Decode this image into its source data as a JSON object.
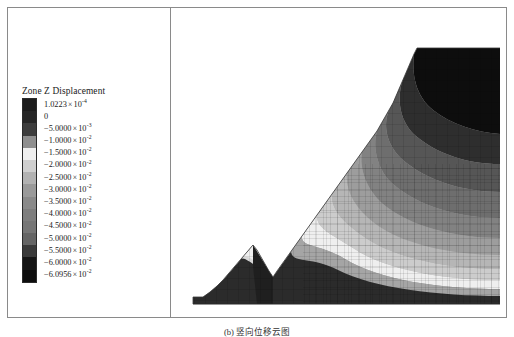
{
  "figure": {
    "caption": "(b) 竖向位移云图",
    "background_color": "#ffffff",
    "frame_color": "#8a8a8a"
  },
  "legend": {
    "title": "Zone Z Displacement",
    "entries": [
      {
        "label": "1.0223 × 10",
        "mantissa": "1.0223",
        "exponent": "-4",
        "color": "#1c1c1c"
      },
      {
        "label": "0",
        "mantissa": "0",
        "exponent": "",
        "color": "#262626"
      },
      {
        "label": "-5.0000 × 10",
        "mantissa": "−5.0000",
        "exponent": "-3",
        "color": "#3d3d3d"
      },
      {
        "label": "-1.0000 × 10",
        "mantissa": "−1.0000",
        "exponent": "-2",
        "color": "#8f8f8f"
      },
      {
        "label": "-1.5000 × 10",
        "mantissa": "−1.5000",
        "exponent": "-2",
        "color": "#efefef"
      },
      {
        "label": "-2.0000 × 10",
        "mantissa": "−2.0000",
        "exponent": "-2",
        "color": "#cfcfcf"
      },
      {
        "label": "-2.5000 × 10",
        "mantissa": "−2.5000",
        "exponent": "-2",
        "color": "#b2b2b2"
      },
      {
        "label": "-3.0000 × 10",
        "mantissa": "−3.0000",
        "exponent": "-2",
        "color": "#9a9a9a"
      },
      {
        "label": "-3.5000 × 10",
        "mantissa": "−3.5000",
        "exponent": "-2",
        "color": "#8a8a8a"
      },
      {
        "label": "-4.0000 × 10",
        "mantissa": "−4.0000",
        "exponent": "-2",
        "color": "#7e7e7e"
      },
      {
        "label": "-4.5000 × 10",
        "mantissa": "−4.5000",
        "exponent": "-2",
        "color": "#767676"
      },
      {
        "label": "-5.0000 × 10",
        "mantissa": "−5.0000",
        "exponent": "-2",
        "color": "#656565"
      },
      {
        "label": "-5.5000 × 10",
        "mantissa": "−5.5000",
        "exponent": "-2",
        "color": "#3a3a3a"
      },
      {
        "label": "-6.0000 × 10",
        "mantissa": "−6.0000",
        "exponent": "-2",
        "color": "#151515"
      },
      {
        "label": "-6.0956 × 10",
        "mantissa": "−6.0956",
        "exponent": "-2",
        "color": "#0d0d0d"
      }
    ]
  },
  "chart_data": {
    "type": "heatmap",
    "title": "Zone Z Displacement",
    "subtype": "finite-element contour fill with mesh overlay",
    "xlabel": "",
    "ylabel": "",
    "grid": false,
    "legend_position": "left-panel",
    "units": "m",
    "value_min": -0.060956,
    "value_max": 0.00010223,
    "contour_levels": [
      0.00010223,
      0,
      -0.005,
      -0.01,
      -0.015,
      -0.02,
      -0.025,
      -0.03,
      -0.035,
      -0.04,
      -0.045,
      -0.05,
      -0.055,
      -0.06,
      -0.060956
    ],
    "band_colors": [
      "#1c1c1c",
      "#262626",
      "#3d3d3d",
      "#8f8f8f",
      "#efefef",
      "#cfcfcf",
      "#b2b2b2",
      "#9a9a9a",
      "#8a8a8a",
      "#7e7e7e",
      "#767676",
      "#656565",
      "#3a3a3a",
      "#151515",
      "#0d0d0d"
    ]
  }
}
